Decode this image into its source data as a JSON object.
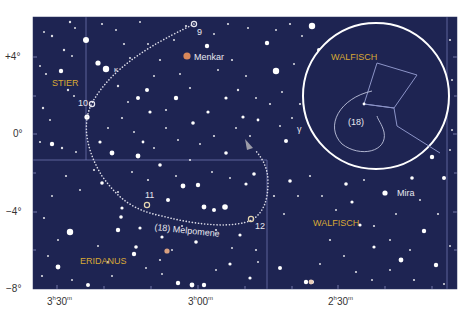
{
  "map": {
    "title": "(18) Melpomene path",
    "colors": {
      "sky": "#1e2452",
      "grid_line": "#7a82b8",
      "label_gold": "#d9a935",
      "star": "#ffffff",
      "text_white": "#e8e8f0",
      "path_dots": "#dcdce8",
      "orange_star": "#d9875a",
      "axis_text": "#333333"
    },
    "dec_axis": [
      {
        "label": "+4°",
        "y": 57
      },
      {
        "label": "0°",
        "y": 134
      },
      {
        "label": "−4°",
        "y": 212
      },
      {
        "label": "−8°",
        "y": 289
      }
    ],
    "ra_axis": [
      {
        "h": "3",
        "m": "30",
        "x": 57
      },
      {
        "h": "3",
        "m": "00",
        "x": 198
      },
      {
        "h": "2",
        "m": "30",
        "x": 338
      }
    ],
    "constellations": [
      {
        "name": "STIER",
        "x": 52,
        "y": 84
      },
      {
        "name": "ERIDANUS",
        "x": 80,
        "y": 262
      },
      {
        "name": "WALFISCH",
        "x": 313,
        "y": 224
      }
    ],
    "star_names": [
      {
        "name": "Menkar",
        "x": 194,
        "y": 60
      },
      {
        "name": "Mira",
        "x": 398,
        "y": 197
      },
      {
        "name": "γ",
        "x": 298,
        "y": 132
      },
      {
        "name": "κ",
        "x": 113,
        "y": 73
      }
    ],
    "path_markers": [
      {
        "label": "9",
        "x": 198,
        "y": 35
      },
      {
        "label": "10",
        "x": 79,
        "y": 107
      },
      {
        "label": "11",
        "x": 145,
        "y": 200
      },
      {
        "label": "12",
        "x": 255,
        "y": 228
      }
    ],
    "asteroid_label": "(18) Melpomene",
    "inset": {
      "constellation": "WALFISCH",
      "path_label": "(18)"
    }
  }
}
